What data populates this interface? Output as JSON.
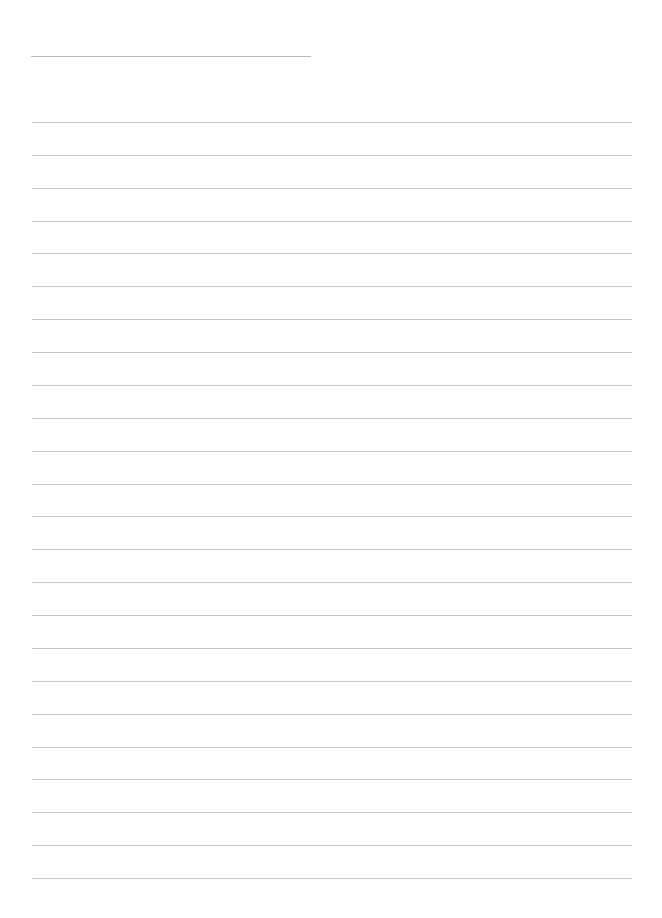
{
  "document": {
    "type": "lined-paper",
    "background_color": "#ffffff",
    "line_color": "#c6c6c6",
    "header_line": {
      "left": 31,
      "top": 56,
      "width": 280
    },
    "rules": {
      "count": 24,
      "first_top": 122,
      "spacing": 32.87,
      "left": 32,
      "width": 600
    }
  }
}
